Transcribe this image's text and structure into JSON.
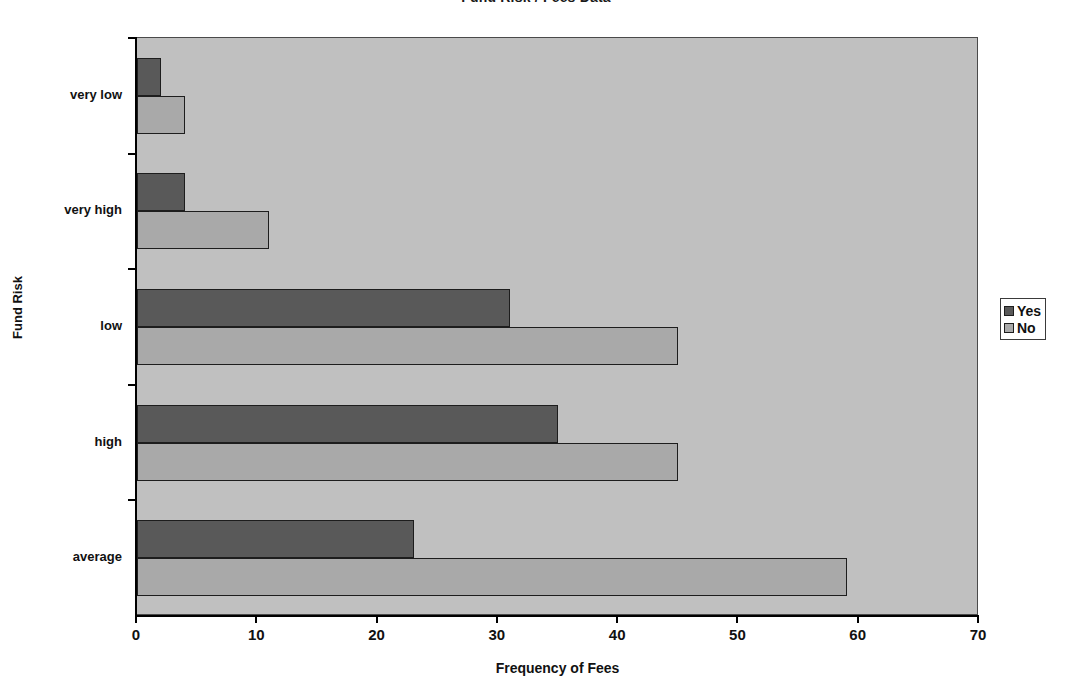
{
  "chart_data": {
    "type": "bar",
    "orientation": "horizontal",
    "title": "Fund Risk / Fees Data",
    "xlabel": "Frequency of Fees",
    "ylabel": "Fund Risk",
    "categories": [
      "very low",
      "very high",
      "low",
      "high",
      "average"
    ],
    "series": [
      {
        "name": "Yes",
        "color": "#595959",
        "values": [
          2,
          4,
          31,
          35,
          23
        ]
      },
      {
        "name": "No",
        "color": "#a9a9a9",
        "values": [
          4,
          11,
          45,
          45,
          59
        ]
      }
    ],
    "xlim": [
      0,
      70
    ],
    "xticks": [
      "0",
      "10",
      "20",
      "30",
      "40",
      "50",
      "60",
      "70"
    ],
    "xtick_values": [
      0,
      10,
      20,
      30,
      40,
      50,
      60,
      70
    ],
    "grid": false,
    "legend_position": "right",
    "plot_background": "#c0c0c0",
    "figure_background": "#ffffff"
  },
  "legend": {
    "entries": [
      {
        "label": "Yes",
        "color": "#595959"
      },
      {
        "label": "No",
        "color": "#a9a9a9"
      }
    ]
  }
}
